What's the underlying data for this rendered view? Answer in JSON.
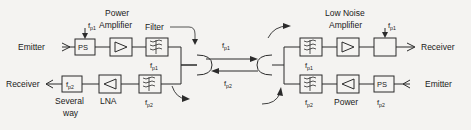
{
  "diagram": {
    "background_color": "#f4f3f1",
    "line_color": "#2b2b2b",
    "annotations": {
      "power_amplifier_line1": "Power",
      "power_amplifier_line2": "Amplifier",
      "low_noise_line1": "Low Noise",
      "low_noise_line2": "Amplifier",
      "filter_label": "Filter",
      "several_way_line1": "Several",
      "several_way_line2": "way",
      "lna_label": "LNA",
      "power_label": "Power"
    },
    "terminals": {
      "left_top": "Emitter",
      "left_bottom": "Receiver",
      "right_top": "Receiver",
      "right_bottom": "Emitter"
    },
    "blocks": {
      "left_top_ps": "PS",
      "right_bottom_ps": "PS",
      "left_bottom_splitter": "f",
      "left_bottom_splitter_sub": "p2",
      "right_top_combiner": ""
    },
    "freq": {
      "f": "f",
      "p1": "p1",
      "p2": "p2"
    },
    "freq_labels": {
      "left_top_ps_input": "f p1",
      "left_filter_top": "f p1",
      "left_filter_bottom": "f p2",
      "link_forward": "f p1",
      "link_reverse": "f p2",
      "right_filter_top": "f p1",
      "right_filter_bottom": "f p2",
      "right_top_combiner_input": "f p1",
      "right_bottom_ps": "f p2"
    }
  }
}
